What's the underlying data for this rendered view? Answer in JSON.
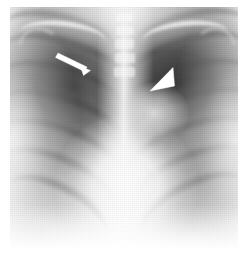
{
  "figure": {
    "modality": "chest-radiograph",
    "view": "PA",
    "caption": "",
    "background_color": "#ffffff",
    "plate": {
      "x": 10,
      "y": 7,
      "width": 228,
      "height": 241,
      "base_color": "#cfcfcf",
      "lung_color": "#3a3a3a",
      "mediastinum_color": "#ffffff"
    }
  },
  "annotations": {
    "marker_color": "#ffffff",
    "items": [
      {
        "id": "arrow",
        "name": "arrow-marker",
        "shape": "arrow",
        "label": "",
        "tail_x": 58,
        "tail_y": 53,
        "tip_x": 89,
        "tip_y": 70,
        "region": "left-upper-lung-field"
      },
      {
        "id": "arrowhead",
        "name": "arrowhead-marker",
        "shape": "solid-triangle",
        "label": "",
        "apex_x": 150,
        "apex_y": 90,
        "tip_x": 150,
        "tip_y": 90,
        "region": "right-hilar-region"
      }
    ]
  },
  "anatomy": {
    "structures": [
      "right lung field",
      "left lung field",
      "mediastinum",
      "thoracic spine",
      "clavicles",
      "posterior ribs",
      "cardiac silhouette",
      "hemidiaphragms"
    ]
  }
}
